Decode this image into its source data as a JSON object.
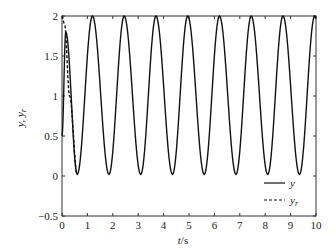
{
  "chart_data": {
    "type": "line",
    "title": "",
    "xlabel": "t/s",
    "ylabel": "y, y_r",
    "xlim": [
      0,
      10
    ],
    "ylim": [
      -0.5,
      2
    ],
    "xticks": [
      "0",
      "1",
      "2",
      "3",
      "4",
      "5",
      "6",
      "7",
      "8",
      "9",
      "10"
    ],
    "yticks": [
      "-0.5",
      "0",
      "0.5",
      "1",
      "1.5",
      "2"
    ],
    "grid": false,
    "legend_position": "lower right",
    "series": [
      {
        "name": "y",
        "style": "solid",
        "description": "Oscillation between 0 and 2 with period ~1.25 s after initial transient (first local peak ~1.8 at t~0.15)",
        "x": [
          0,
          0.15,
          0.6,
          1.2,
          1.85,
          2.45,
          3.1,
          3.7,
          4.35,
          4.95,
          5.6,
          6.2,
          6.85,
          7.45,
          8.1,
          8.7,
          9.35,
          9.95
        ],
        "values": [
          0.5,
          1.8,
          0.02,
          2.0,
          0.02,
          2.0,
          0.02,
          2.0,
          0.02,
          2.0,
          0.02,
          2.0,
          0.02,
          2.0,
          0.02,
          2.0,
          0.02,
          2.0
        ]
      },
      {
        "name": "y_r",
        "style": "dashed",
        "description": "Reference starts at 2 and decreases to ~0 by t~0.6, then overlaps y",
        "x": [
          0,
          0.1,
          0.3,
          0.6
        ],
        "values": [
          2.0,
          1.9,
          1.0,
          0.02
        ]
      }
    ]
  },
  "labels": {
    "xlabel_t": "t",
    "xlabel_unit": "/s",
    "ylabel": "y, y",
    "ylabel_sub": "r",
    "legend_y": "y",
    "legend_yr": "y",
    "legend_yr_sub": "r"
  }
}
